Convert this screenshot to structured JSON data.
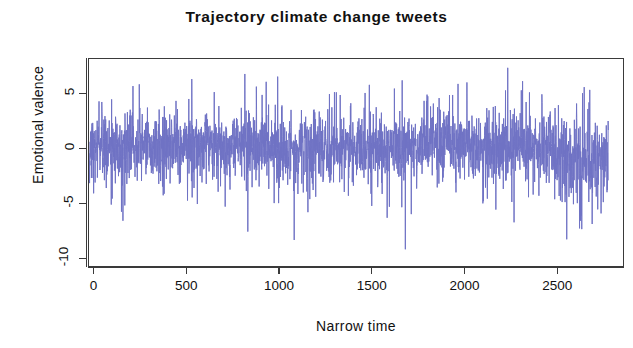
{
  "chart_data": {
    "type": "line",
    "title": "Trajectory climate change tweets",
    "subtitle": "",
    "xlabel": "Narrow time",
    "ylabel": "Emotional valence",
    "xlim": [
      -30,
      2860
    ],
    "ylim": [
      -10.8,
      8.2
    ],
    "xticks": [
      0,
      500,
      1000,
      1500,
      2000,
      2500
    ],
    "xtick_labels": [
      "0",
      "500",
      "1000",
      "1500",
      "2000",
      "2500"
    ],
    "yticks": [
      5,
      0,
      -5,
      -10
    ],
    "ytick_labels": [
      "5",
      "0",
      "-5",
      "-10"
    ],
    "grid": false,
    "legend": null,
    "series_color": "#6f72c4",
    "line_width": 1,
    "n_points": 2800,
    "series": [
      {
        "name": "Emotional valence",
        "description": "Dense high-frequency fluctuating valence time series, centred near 0, bulk between -2 and +2, with frequent spikes to +5..+7 and downward excursions to -5..-9.",
        "mean": 0.25,
        "sd": 1.9,
        "min": -9.1,
        "max": 7.4,
        "noted_extremes": [
          {
            "x": 1730,
            "y": -9.1,
            "note": "deepest negative spike"
          },
          {
            "x": 2300,
            "y": 7.4,
            "note": "tallest positive spike"
          },
          {
            "x": 1020,
            "y": 6.6,
            "note": "positive spike"
          },
          {
            "x": 2700,
            "y": -7.2,
            "note": "late negative cluster"
          },
          {
            "x": 2770,
            "y": -6.8,
            "note": "late negative cluster"
          }
        ]
      }
    ]
  },
  "figure": {
    "background": "#ffffff",
    "axis_color": "#3a3a3a",
    "text_color": "#111111"
  }
}
